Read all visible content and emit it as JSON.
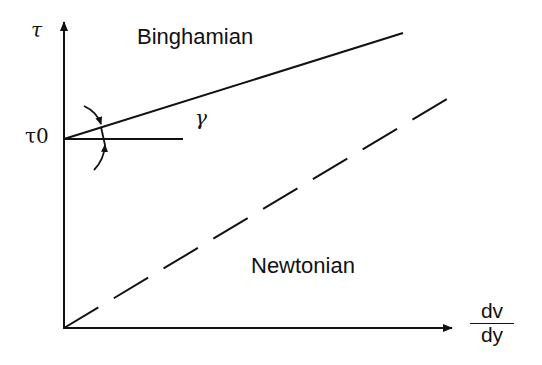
{
  "diagram": {
    "type": "rheology shear stress vs shear rate",
    "y_axis": {
      "label": "τ",
      "intercept_label": "τ0"
    },
    "x_axis": {
      "label_numerator": "dv",
      "label_denominator": "dy"
    },
    "curves": [
      {
        "name": "Binghamian",
        "style": "solid",
        "intercept": "τ0",
        "slope_angle_label": "γ"
      },
      {
        "name": "Newtonian",
        "style": "dashed",
        "intercept": "0"
      }
    ],
    "labels": {
      "binghamian": "Binghamian",
      "newtonian": "Newtonian",
      "tau": "τ",
      "tau0": "τ0",
      "gamma": "γ",
      "dv": "dv",
      "dy": "dy"
    },
    "colors": {
      "ink": "#111111",
      "background": "#ffffff"
    }
  }
}
